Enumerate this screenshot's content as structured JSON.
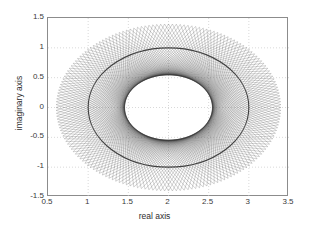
{
  "chart_data": {
    "type": "line",
    "title": "",
    "xlabel": "real axis",
    "ylabel": "imaginary axis",
    "xlim": [
      0.5,
      3.5
    ],
    "ylim": [
      -1.5,
      1.5
    ],
    "xticks": [
      "0.5",
      "1",
      "1.5",
      "2",
      "2.5",
      "3",
      "3.5"
    ],
    "xtick_values": [
      0.5,
      1,
      1.5,
      2,
      2.5,
      3,
      3.5
    ],
    "yticks": [
      "1.5",
      "1",
      "0.5",
      "0",
      "-0.5",
      "-1",
      "-1.5"
    ],
    "ytick_values": [
      1.5,
      1,
      0.5,
      0,
      -0.5,
      -1,
      -1.5
    ],
    "grid": true,
    "grid_style": "dotted",
    "grid_color": "#c8c8c8",
    "axes_color": "#8c8c8c",
    "background": "#ffffff",
    "legend": null,
    "series": [
      {
        "name": "chord envelope",
        "color": "#303030",
        "description": "Dense family of straight chord segments whose envelope forms an annular band around an ellipse centred at (2,0).",
        "inner_envelope": {
          "shape": "ellipse",
          "center_x": 2.0,
          "center_y": 0.0,
          "semi_axis_x": 1.0,
          "semi_axis_y": 1.0
        },
        "outer_envelope": {
          "shape": "ellipse",
          "center_x": 2.0,
          "center_y": 0.0,
          "semi_axis_x": 1.4,
          "semi_axis_y": 1.4
        },
        "chord_count": 180,
        "chord_source_radius_x": 1.4,
        "chord_source_radius_y": 1.4,
        "chord_step_degrees": 2,
        "chord_span_degrees": 134
      }
    ],
    "annotations": []
  },
  "axis": {
    "x_label": "real axis",
    "y_label": "imaginary axis"
  }
}
